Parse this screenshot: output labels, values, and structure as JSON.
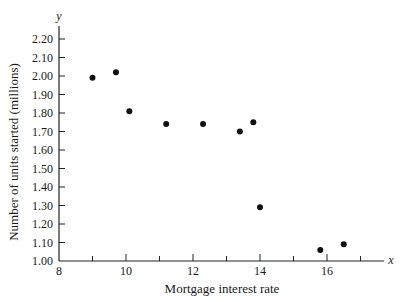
{
  "chart_data": {
    "type": "scatter",
    "title": "",
    "xlabel": "Mortgage interest rate",
    "ylabel": "Number of units started (millions)",
    "x_axis_symbol": "x",
    "y_axis_symbol": "y",
    "xlim": [
      8,
      17.7
    ],
    "ylim": [
      1.0,
      2.25
    ],
    "x_ticks": [
      8,
      9,
      10,
      11,
      12,
      13,
      14,
      15,
      16,
      17
    ],
    "x_tick_labels": [
      "8",
      "",
      "10",
      "",
      "12",
      "",
      "14",
      "",
      "16",
      ""
    ],
    "y_ticks": [
      1.0,
      1.1,
      1.2,
      1.3,
      1.4,
      1.5,
      1.6,
      1.7,
      1.8,
      1.9,
      2.0,
      2.1,
      2.2
    ],
    "y_tick_labels": [
      "1.00",
      "1.10",
      "1.20",
      "1.30",
      "1.40",
      "1.50",
      "1.60",
      "1.70",
      "1.80",
      "1.90",
      "2.00",
      "2.10",
      "2.20"
    ],
    "grid": false,
    "legend": null,
    "points": [
      {
        "x": 9.0,
        "y": 1.99
      },
      {
        "x": 9.7,
        "y": 2.02
      },
      {
        "x": 10.1,
        "y": 1.81
      },
      {
        "x": 11.2,
        "y": 1.74
      },
      {
        "x": 12.3,
        "y": 1.74
      },
      {
        "x": 13.4,
        "y": 1.7
      },
      {
        "x": 13.8,
        "y": 1.75
      },
      {
        "x": 14.0,
        "y": 1.29
      },
      {
        "x": 15.8,
        "y": 1.06
      },
      {
        "x": 16.5,
        "y": 1.09
      }
    ],
    "marker_color": "#111111"
  }
}
